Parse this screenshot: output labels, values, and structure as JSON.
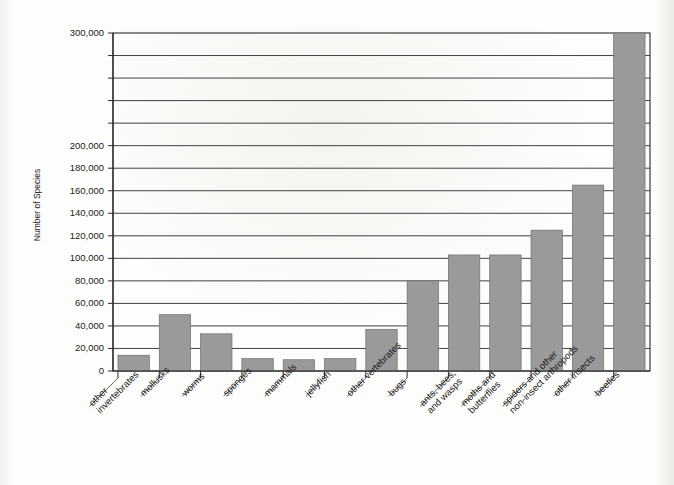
{
  "chart_data": {
    "type": "bar",
    "title": "",
    "subtitle": "",
    "xlabel": "",
    "ylabel": "Number of Species",
    "ylim": [
      0,
      300000
    ],
    "ytick_step": 20000,
    "grid": true,
    "legend": "none",
    "orientation": "vertical",
    "bar_color": "#9a9a9a",
    "bar_edge_color": "#6e6e6e",
    "axis_color": "#2b2b2b",
    "background_color": "#fdfdfb",
    "categories": [
      "other\ninvertebrates",
      "mollusks",
      "worms",
      "sponges",
      "mammals",
      "jellyfish",
      "other vertebrates",
      "bugs",
      "ants, bees,\nand wasps",
      "moths and\nbutterflies",
      "spiders and other\nnon-insect arthropods",
      "other insects",
      "beetles"
    ],
    "values": [
      14000,
      50000,
      33000,
      11000,
      10000,
      11000,
      37000,
      80000,
      103000,
      103000,
      125000,
      165000,
      300000
    ],
    "ytick_values": [
      0,
      20000,
      40000,
      60000,
      80000,
      100000,
      120000,
      140000,
      160000,
      180000,
      200000,
      220000,
      240000,
      260000,
      280000,
      300000
    ],
    "ytick_labels": [
      "0",
      "20,000",
      "40,000",
      "60,000",
      "80,000",
      "100,000",
      "120,000",
      "140,000",
      "160,000",
      "180,000",
      "200,000",
      "",
      "",
      "",
      "",
      "300,000"
    ],
    "category_label_rotation_degrees": -45
  }
}
